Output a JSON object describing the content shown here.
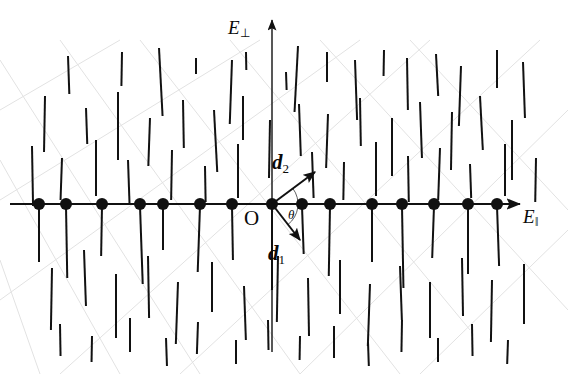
{
  "figure": {
    "width": 568,
    "height": 374,
    "background": "#ffffff",
    "ink_color": "#111111",
    "grid_color": "#e2e2e2"
  },
  "axes": {
    "vertical": {
      "label": "E",
      "subscript": "⊥",
      "label_x": 228,
      "label_y": 18,
      "x": 272,
      "y_top": 20,
      "y_bottom": 352,
      "arrow": "up"
    },
    "horizontal": {
      "label": "E",
      "subscript": "‖",
      "label_x": 523,
      "label_y": 207,
      "y": 204,
      "x_left": 10,
      "x_right": 520,
      "arrow": "right"
    },
    "origin": {
      "label": "O",
      "x": 244,
      "y": 208
    }
  },
  "vectors": {
    "origin_site": {
      "x": 272,
      "y": 204
    },
    "d2": {
      "label": "d",
      "subscript": "2",
      "tip_x": 315,
      "tip_y": 172,
      "label_x": 272,
      "label_y": 152
    },
    "d1": {
      "label": "d",
      "subscript": "1",
      "tip_x": 300,
      "tip_y": 240,
      "label_x": 268,
      "label_y": 243
    },
    "angle": {
      "label": "θ",
      "label_x": 288,
      "label_y": 208
    }
  },
  "chart_data": {
    "type": "scatter",
    "title": "",
    "xlabel": "E‖",
    "ylabel": "E⊥",
    "grid": "faint diagonal lattice lines",
    "axis_row_sites": {
      "note": "filled circles on the horizontal axis (y = 204)",
      "radius": 6,
      "x": [
        39,
        66,
        102,
        140,
        163,
        200,
        232,
        272,
        302,
        330,
        372,
        402,
        434,
        468,
        497
      ]
    },
    "dipole_segments": {
      "note": "near-vertical line segments; x, y_top, y_bottom, tilt degrees",
      "items": [
        [
          68,
          56,
          94,
          2
        ],
        [
          122,
          52,
          86,
          -1
        ],
        [
          159,
          48,
          116,
          3
        ],
        [
          196,
          58,
          74,
          0
        ],
        [
          232,
          60,
          124,
          -2
        ],
        [
          246,
          52,
          70,
          1
        ],
        [
          286,
          72,
          90,
          2
        ],
        [
          298,
          46,
          112,
          -3
        ],
        [
          327,
          52,
          82,
          0
        ],
        [
          355,
          60,
          120,
          2
        ],
        [
          384,
          50,
          76,
          -1
        ],
        [
          407,
          58,
          110,
          1
        ],
        [
          436,
          54,
          96,
          3
        ],
        [
          461,
          66,
          126,
          -2
        ],
        [
          497,
          50,
          88,
          0
        ],
        [
          523,
          62,
          118,
          2
        ],
        [
          45,
          96,
          152,
          -1
        ],
        [
          86,
          108,
          144,
          2
        ],
        [
          118,
          92,
          160,
          0
        ],
        [
          150,
          118,
          166,
          -2
        ],
        [
          183,
          100,
          148,
          1
        ],
        [
          214,
          110,
          172,
          3
        ],
        [
          243,
          96,
          140,
          0
        ],
        [
          270,
          120,
          178,
          -1
        ],
        [
          299,
          104,
          156,
          2
        ],
        [
          328,
          114,
          168,
          -2
        ],
        [
          360,
          98,
          146,
          1
        ],
        [
          392,
          118,
          176,
          0
        ],
        [
          420,
          102,
          158,
          2
        ],
        [
          452,
          112,
          170,
          -1
        ],
        [
          480,
          96,
          150,
          3
        ],
        [
          512,
          120,
          180,
          0
        ],
        [
          32,
          146,
          206,
          1
        ],
        [
          62,
          158,
          200,
          -2
        ],
        [
          96,
          140,
          196,
          0
        ],
        [
          128,
          160,
          204,
          2
        ],
        [
          172,
          150,
          200,
          -1
        ],
        [
          205,
          166,
          202,
          1
        ],
        [
          238,
          144,
          198,
          0
        ],
        [
          312,
          152,
          198,
          2
        ],
        [
          344,
          162,
          200,
          -1
        ],
        [
          376,
          142,
          196,
          0
        ],
        [
          408,
          156,
          202,
          1
        ],
        [
          440,
          148,
          200,
          -2
        ],
        [
          470,
          164,
          198,
          2
        ],
        [
          505,
          144,
          196,
          0
        ],
        [
          536,
          158,
          202,
          -1
        ],
        [
          39,
          206,
          262,
          0
        ],
        [
          66,
          206,
          278,
          1
        ],
        [
          102,
          206,
          256,
          -1
        ],
        [
          140,
          206,
          284,
          2
        ],
        [
          163,
          206,
          250,
          0
        ],
        [
          200,
          206,
          272,
          -2
        ],
        [
          232,
          206,
          260,
          1
        ],
        [
          272,
          206,
          290,
          0
        ],
        [
          302,
          206,
          254,
          2
        ],
        [
          330,
          206,
          276,
          -1
        ],
        [
          372,
          206,
          262,
          0
        ],
        [
          402,
          206,
          288,
          1
        ],
        [
          434,
          206,
          258,
          -2
        ],
        [
          468,
          206,
          274,
          0
        ],
        [
          497,
          206,
          266,
          2
        ],
        [
          52,
          268,
          330,
          -1
        ],
        [
          84,
          250,
          306,
          2
        ],
        [
          116,
          274,
          338,
          0
        ],
        [
          148,
          256,
          318,
          1
        ],
        [
          178,
          282,
          344,
          -2
        ],
        [
          212,
          262,
          312,
          0
        ],
        [
          244,
          286,
          340,
          2
        ],
        [
          278,
          256,
          322,
          -1
        ],
        [
          308,
          278,
          336,
          1
        ],
        [
          340,
          260,
          314,
          0
        ],
        [
          370,
          284,
          346,
          -2
        ],
        [
          400,
          266,
          320,
          2
        ],
        [
          430,
          282,
          338,
          0
        ],
        [
          462,
          258,
          316,
          1
        ],
        [
          492,
          280,
          342,
          -1
        ],
        [
          524,
          264,
          324,
          0
        ],
        [
          60,
          324,
          356,
          1
        ],
        [
          92,
          336,
          362,
          -1
        ],
        [
          130,
          318,
          352,
          0
        ],
        [
          166,
          338,
          366,
          2
        ],
        [
          198,
          322,
          354,
          -2
        ],
        [
          236,
          340,
          364,
          0
        ],
        [
          268,
          320,
          350,
          1
        ],
        [
          300,
          336,
          360,
          -1
        ],
        [
          334,
          326,
          358,
          0
        ],
        [
          368,
          342,
          366,
          2
        ],
        [
          402,
          320,
          352,
          -1
        ],
        [
          438,
          338,
          362,
          0
        ],
        [
          472,
          324,
          356,
          1
        ],
        [
          508,
          340,
          364,
          -2
        ]
      ]
    },
    "grid_lines": {
      "note": "faint diagonal guide lines of the underlying lattice",
      "slope_down": [
        [
          0,
          60,
          200,
          374
        ],
        [
          60,
          40,
          300,
          374
        ],
        [
          140,
          40,
          400,
          374
        ],
        [
          230,
          40,
          470,
          330
        ],
        [
          320,
          40,
          568,
          310
        ],
        [
          410,
          40,
          568,
          210
        ],
        [
          0,
          160,
          120,
          374
        ],
        [
          0,
          260,
          40,
          374
        ]
      ],
      "slope_up": [
        [
          0,
          200,
          260,
          40
        ],
        [
          0,
          300,
          360,
          40
        ],
        [
          60,
          374,
          430,
          40
        ],
        [
          180,
          374,
          540,
          40
        ],
        [
          300,
          374,
          568,
          110
        ],
        [
          420,
          374,
          568,
          230
        ],
        [
          0,
          110,
          120,
          40
        ]
      ]
    }
  }
}
